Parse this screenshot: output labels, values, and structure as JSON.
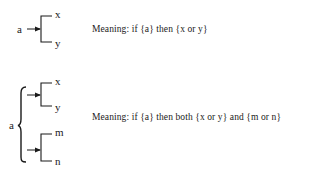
{
  "diagram_1": {
    "input_label": "a",
    "outputs": [
      "x",
      "y"
    ],
    "meaning_text": "Meaning: if {a} then {x or y}"
  },
  "diagram_2": {
    "input_label": "a",
    "branches": [
      {
        "outputs": [
          "x",
          "y"
        ]
      },
      {
        "outputs": [
          "m",
          "n"
        ]
      }
    ],
    "meaning_text": "Meaning: if {a} then both {x or y} and {m or n}"
  },
  "colors": {
    "ink": "#1a1a1a",
    "background": "#ffffff"
  }
}
